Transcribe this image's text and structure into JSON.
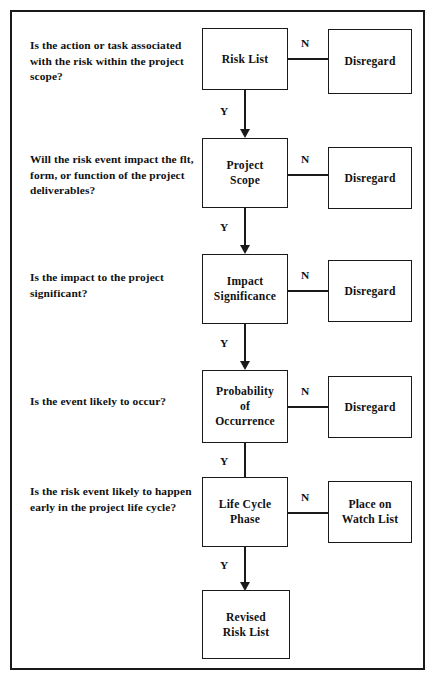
{
  "diagram": {
    "frame_color": "#1a1a1a",
    "background": "#ffffff"
  },
  "questions": [
    {
      "id": "q-scope",
      "text": "Is the action or task associated with the risk within the project scope?"
    },
    {
      "id": "q-impact",
      "text": "Will the risk event impact the flt, form, or function of the project deliverables?"
    },
    {
      "id": "q-significance",
      "text": "Is the impact to the project significant?"
    },
    {
      "id": "q-probability",
      "text": "Is the event likely to occur?"
    },
    {
      "id": "q-lifecycle",
      "text": "Is the risk event likely to happen early in the project life cycle?"
    }
  ],
  "nodes": {
    "risk_list": {
      "label": "Risk List",
      "line1": "Risk List",
      "line2": ""
    },
    "project_scope": {
      "label": "Project Scope",
      "line1": "Project",
      "line2": "Scope"
    },
    "impact_significance": {
      "label": "Impact Significance",
      "line1": "Impact",
      "line2": "Significance"
    },
    "probability": {
      "label": "Probability of Occurrence",
      "line1": "Probability",
      "line2": "of",
      "line3": "Occurrence"
    },
    "life_cycle_phase": {
      "label": "Life Cycle Phase",
      "line1": "Life Cycle",
      "line2": "Phase"
    },
    "revised_risk_list": {
      "label": "Revised Risk List",
      "line1": "Revised",
      "line2": "Risk List"
    },
    "disregard_1": {
      "label": "Disregard"
    },
    "disregard_2": {
      "label": "Disregard"
    },
    "disregard_3": {
      "label": "Disregard"
    },
    "disregard_4": {
      "label": "Disregard"
    },
    "watch_list": {
      "label": "Place on Watch List",
      "line1": "Place on",
      "line2": "Watch List"
    }
  },
  "edge_labels": {
    "no_1": "N",
    "no_2": "N",
    "no_3": "N",
    "no_4": "N",
    "no_5": "N",
    "yes_1": "Y",
    "yes_2": "Y",
    "yes_3": "Y",
    "yes_4": "Y",
    "yes_5": "Y"
  }
}
